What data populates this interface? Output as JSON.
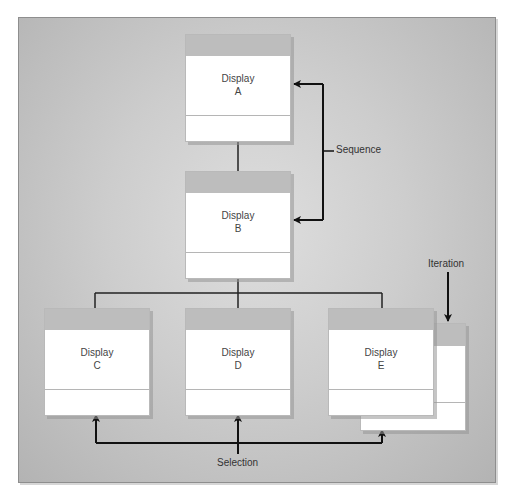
{
  "diagram": {
    "type": "structure-chart",
    "boxes": [
      {
        "id": "A",
        "line1": "Display",
        "line2": "A"
      },
      {
        "id": "B",
        "line1": "Display",
        "line2": "B"
      },
      {
        "id": "C",
        "line1": "Display",
        "line2": "C"
      },
      {
        "id": "D",
        "line1": "Display",
        "line2": "D"
      },
      {
        "id": "E",
        "line1": "Display",
        "line2": "E"
      }
    ],
    "annotations": {
      "sequence": "Sequence",
      "iteration": "Iteration",
      "selection": "Selection"
    },
    "colors": {
      "panel": "#c8c8c8",
      "box_header": "#bdbdbd",
      "box_body": "#ffffff",
      "line": "#111111"
    }
  }
}
